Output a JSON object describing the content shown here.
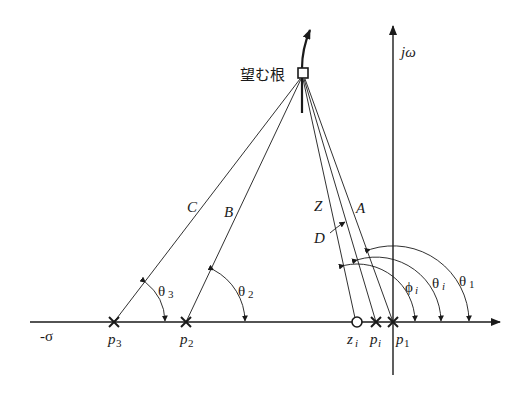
{
  "diagram": {
    "type": "root-locus-angle-condition",
    "axes": {
      "real_axis_label": "-σ",
      "imag_axis_label": "jω"
    },
    "desired_root": {
      "label": "望む根",
      "marker": "square"
    },
    "poles": [
      {
        "id": "p3",
        "label": "p",
        "sub": "3",
        "x": 114
      },
      {
        "id": "p2",
        "label": "p",
        "sub": "2",
        "x": 186
      },
      {
        "id": "pi",
        "label": "p",
        "sub": "i",
        "x": 376
      },
      {
        "id": "p1",
        "label": "p",
        "sub": "1",
        "x": 393
      }
    ],
    "zeros": [
      {
        "id": "zi",
        "label": "z",
        "sub": "i",
        "x": 357
      }
    ],
    "vectors": [
      {
        "label": "C",
        "from": "p3"
      },
      {
        "label": "B",
        "from": "p2"
      },
      {
        "label": "Z",
        "from": "zi"
      },
      {
        "label": "D",
        "from": "pi"
      },
      {
        "label": "A",
        "from": "p1"
      }
    ],
    "angles": [
      {
        "label": "θ",
        "sub": "3",
        "at": "p3"
      },
      {
        "label": "θ",
        "sub": "2",
        "at": "p2"
      },
      {
        "label": "ϕ",
        "sub": "i",
        "at": "zi"
      },
      {
        "label": "θ",
        "sub": "i",
        "at": "pi"
      },
      {
        "label": "θ",
        "sub": "1",
        "at": "p1"
      }
    ],
    "colors": {
      "ink": "#1a1a1a",
      "background": "#ffffff"
    }
  }
}
